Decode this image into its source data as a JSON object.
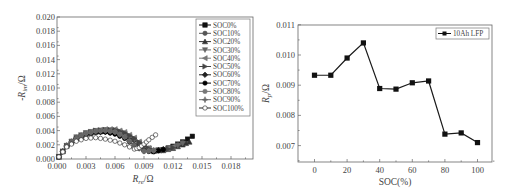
{
  "chart_data": [
    {
      "type": "scatter",
      "title": "",
      "xlabel": "R_re/Ω",
      "ylabel": "-R_im/Ω",
      "xlim": [
        0.0,
        0.019
      ],
      "ylim": [
        0.0,
        0.02
      ],
      "x_ticks": [
        "0.000",
        "0.003",
        "0.006",
        "0.009",
        "0.012",
        "0.015",
        "0.018"
      ],
      "y_ticks": [
        "0.000",
        "0.002",
        "0.004",
        "0.006",
        "0.008",
        "0.010",
        "0.012",
        "0.014",
        "0.016",
        "0.018",
        "0.020"
      ],
      "grid": false,
      "legend_position": "upper right",
      "legend": [
        "SOC0%",
        "SOC10%",
        "SOC20%",
        "SOC30%",
        "SOC40%",
        "SOC50%",
        "SOC60%",
        "SOC70%",
        "SOC80%",
        "SOC90%",
        "SOC100%"
      ],
      "series": [
        {
          "name": "SOC0%",
          "marker": "square",
          "x": [
            0.0002,
            0.001,
            0.002,
            0.003,
            0.004,
            0.005,
            0.006,
            0.007,
            0.008,
            0.009,
            0.01,
            0.011,
            0.012,
            0.013,
            0.014
          ],
          "y": [
            0.0003,
            0.0018,
            0.0029,
            0.0035,
            0.0038,
            0.0039,
            0.0038,
            0.0034,
            0.0027,
            0.0017,
            0.0012,
            0.0013,
            0.0018,
            0.0024,
            0.0032
          ]
        },
        {
          "name": "SOC10%",
          "marker": "circle",
          "x": [
            0.0002,
            0.001,
            0.002,
            0.003,
            0.004,
            0.005,
            0.006,
            0.007,
            0.008,
            0.009,
            0.01,
            0.011,
            0.012,
            0.013
          ],
          "y": [
            0.0003,
            0.0018,
            0.0029,
            0.0035,
            0.0038,
            0.0039,
            0.0038,
            0.0034,
            0.0027,
            0.0017,
            0.0012,
            0.0013,
            0.0017,
            0.0023
          ]
        },
        {
          "name": "SOC20%",
          "marker": "triangle-up",
          "x": [
            0.0002,
            0.001,
            0.002,
            0.003,
            0.004,
            0.005,
            0.006,
            0.007,
            0.008,
            0.009,
            0.01,
            0.011,
            0.012,
            0.013,
            0.0137
          ],
          "y": [
            0.0003,
            0.0019,
            0.003,
            0.0036,
            0.0039,
            0.004,
            0.0039,
            0.0035,
            0.0028,
            0.0018,
            0.0012,
            0.0012,
            0.0015,
            0.002,
            0.0024
          ]
        },
        {
          "name": "SOC30%",
          "marker": "triangle-down",
          "x": [
            0.0002,
            0.001,
            0.002,
            0.003,
            0.004,
            0.005,
            0.006,
            0.007,
            0.008,
            0.009,
            0.01,
            0.011,
            0.012,
            0.013
          ],
          "y": [
            0.0003,
            0.0019,
            0.0031,
            0.0037,
            0.004,
            0.0041,
            0.004,
            0.0036,
            0.0028,
            0.0018,
            0.0012,
            0.0012,
            0.0016,
            0.0022
          ]
        },
        {
          "name": "SOC40%",
          "marker": "triangle-left",
          "x": [
            0.0002,
            0.001,
            0.002,
            0.003,
            0.004,
            0.005,
            0.006,
            0.007,
            0.008,
            0.009,
            0.01,
            0.011,
            0.012
          ],
          "y": [
            0.0003,
            0.0018,
            0.0029,
            0.0036,
            0.004,
            0.0042,
            0.0042,
            0.0038,
            0.003,
            0.0019,
            0.0012,
            0.0013,
            0.0017
          ]
        },
        {
          "name": "SOC50%",
          "marker": "triangle-right",
          "x": [
            0.0002,
            0.001,
            0.002,
            0.003,
            0.004,
            0.005,
            0.006,
            0.007,
            0.008,
            0.009,
            0.01,
            0.011,
            0.012
          ],
          "y": [
            0.0003,
            0.0018,
            0.0029,
            0.0036,
            0.004,
            0.0041,
            0.0041,
            0.0037,
            0.0029,
            0.0018,
            0.0011,
            0.0012,
            0.0016
          ]
        },
        {
          "name": "SOC60%",
          "marker": "diamond",
          "x": [
            0.0002,
            0.001,
            0.002,
            0.003,
            0.004,
            0.005,
            0.006,
            0.007,
            0.008,
            0.009,
            0.01,
            0.011
          ],
          "y": [
            0.0003,
            0.0018,
            0.0029,
            0.0035,
            0.0038,
            0.0038,
            0.0036,
            0.003,
            0.002,
            0.0012,
            0.0011,
            0.0014
          ]
        },
        {
          "name": "SOC70%",
          "marker": "hexagon",
          "x": [
            0.0002,
            0.001,
            0.002,
            0.003,
            0.004,
            0.005,
            0.006,
            0.007,
            0.008,
            0.009,
            0.01,
            0.011
          ],
          "y": [
            0.0003,
            0.0018,
            0.0029,
            0.0035,
            0.0038,
            0.0038,
            0.0035,
            0.0029,
            0.0019,
            0.0011,
            0.001,
            0.0013
          ]
        },
        {
          "name": "SOC80%",
          "marker": "pentagon",
          "x": [
            0.0002,
            0.001,
            0.002,
            0.003,
            0.004,
            0.005,
            0.006,
            0.007,
            0.008,
            0.009,
            0.01
          ],
          "y": [
            0.0003,
            0.0018,
            0.0029,
            0.0036,
            0.0039,
            0.004,
            0.0038,
            0.0031,
            0.0019,
            0.0011,
            0.0012
          ]
        },
        {
          "name": "SOC90%",
          "marker": "star",
          "x": [
            0.0002,
            0.001,
            0.002,
            0.003,
            0.004,
            0.005,
            0.006,
            0.007,
            0.008,
            0.009,
            0.01
          ],
          "y": [
            0.0003,
            0.0019,
            0.003,
            0.0036,
            0.0039,
            0.004,
            0.0038,
            0.0031,
            0.0019,
            0.0011,
            0.0012
          ]
        },
        {
          "name": "SOC100%",
          "marker": "circle-open",
          "x": [
            0.0002,
            0.001,
            0.002,
            0.003,
            0.004,
            0.005,
            0.006,
            0.007,
            0.008,
            0.0085,
            0.009,
            0.0095,
            0.0102
          ],
          "y": [
            0.0003,
            0.0017,
            0.0025,
            0.0029,
            0.003,
            0.0028,
            0.0025,
            0.002,
            0.0014,
            0.0016,
            0.0021,
            0.0027,
            0.0034
          ]
        }
      ]
    },
    {
      "type": "line",
      "title": "",
      "xlabel": "SOC(%)",
      "ylabel": "R_p/Ω",
      "xlim": [
        -10,
        108
      ],
      "ylim": [
        0.0065,
        0.011
      ],
      "x_ticks": [
        "0",
        "20",
        "40",
        "60",
        "80",
        "100"
      ],
      "y_ticks": [
        "0.007",
        "0.008",
        "0.009",
        "0.010",
        "0.011"
      ],
      "grid": false,
      "legend_position": "upper right",
      "legend": [
        "10Ah LFP"
      ],
      "categories": [
        0,
        10,
        20,
        30,
        40,
        50,
        60,
        70,
        80,
        90,
        100
      ],
      "series": [
        {
          "name": "10Ah LFP",
          "marker": "square",
          "x": [
            0,
            10,
            20,
            30,
            40,
            50,
            60,
            70,
            80,
            90,
            100
          ],
          "values": [
            0.00933,
            0.00933,
            0.0099,
            0.0104,
            0.00889,
            0.00887,
            0.00908,
            0.00914,
            0.00738,
            0.00742,
            0.0071
          ]
        }
      ]
    }
  ],
  "left_chart": {
    "ylabel_prefix": "-R",
    "ylabel_sub": "im",
    "ylabel_suffix": "/Ω",
    "xlabel_prefix": "R",
    "xlabel_sub": "re",
    "xlabel_suffix": "/Ω"
  },
  "right_chart": {
    "ylabel_prefix": "R",
    "ylabel_sub": "p",
    "ylabel_suffix": "/Ω",
    "xlabel": "SOC(%)",
    "legend_label": "10Ah LFP"
  },
  "colors": {
    "axis": "#666666",
    "series_dark": "#1a1a1a",
    "series_grays": [
      "#111111",
      "#555555",
      "#333333",
      "#666666",
      "#777777",
      "#444444",
      "#222222",
      "#000000",
      "#777777",
      "#666666",
      "#222222"
    ]
  }
}
